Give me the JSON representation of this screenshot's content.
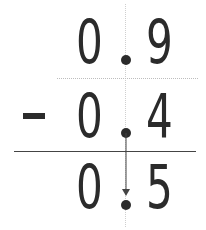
{
  "problem": {
    "operation": "subtraction",
    "operator_symbol": "-",
    "minuend": {
      "whole": "0",
      "tenths": "9"
    },
    "subtrahend": {
      "whole": "0",
      "tenths": "4"
    },
    "difference": {
      "whole": "0",
      "tenths": "5"
    }
  },
  "colors": {
    "digit": "#2b2b2b",
    "guide": "#cfcfcf",
    "rule": "#444444"
  }
}
